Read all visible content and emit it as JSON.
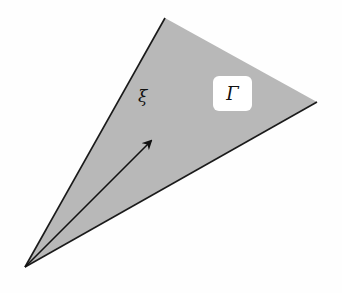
{
  "diagram": {
    "cone": {
      "apex": [
        25,
        267
      ],
      "top_vertex": [
        165,
        18
      ],
      "right_vertex": [
        317,
        102
      ],
      "fill": "#b8b8b8",
      "stroke": "#1a1a1a"
    },
    "arrow": {
      "from": [
        25,
        267
      ],
      "to": [
        151,
        141
      ],
      "label": "ξ"
    },
    "region_label": "Γ"
  }
}
